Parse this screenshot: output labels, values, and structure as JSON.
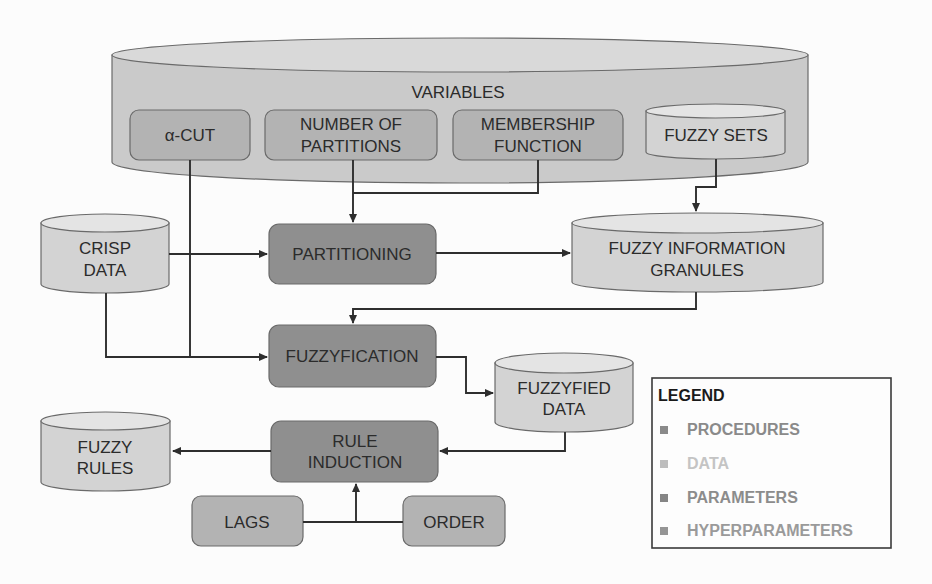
{
  "nodes": {
    "variables": {
      "label": "VARIABLES"
    },
    "alpha_cut": {
      "lines": [
        "α-CUT"
      ]
    },
    "number_of_partitions": {
      "lines": [
        "NUMBER OF",
        "PARTITIONS"
      ]
    },
    "membership_function": {
      "lines": [
        "MEMBERSHIP",
        "FUNCTION"
      ]
    },
    "fuzzy_sets": {
      "lines": [
        "FUZZY SETS"
      ]
    },
    "crisp_data": {
      "lines": [
        "CRISP",
        "DATA"
      ]
    },
    "partitioning": {
      "lines": [
        "PARTITIONING"
      ]
    },
    "fuzzy_information_granules": {
      "lines": [
        "FUZZY INFORMATION",
        "GRANULES"
      ]
    },
    "fuzzyfication": {
      "lines": [
        "FUZZYFICATION"
      ]
    },
    "fuzzyfied_data": {
      "lines": [
        "FUZZYFIED",
        "DATA"
      ]
    },
    "rule_induction": {
      "lines": [
        "RULE",
        "INDUCTION"
      ]
    },
    "fuzzy_rules": {
      "lines": [
        "FUZZY",
        "RULES"
      ]
    },
    "lags": {
      "lines": [
        "LAGS"
      ]
    },
    "order": {
      "lines": [
        "ORDER"
      ]
    }
  },
  "edges": [
    {
      "from": "number_of_partitions",
      "to": "partitioning"
    },
    {
      "from": "membership_function",
      "to": "partitioning"
    },
    {
      "from": "crisp_data",
      "to": "partitioning"
    },
    {
      "from": "fuzzy_sets",
      "to": "fuzzy_information_granules"
    },
    {
      "from": "partitioning",
      "to": "fuzzy_information_granules"
    },
    {
      "from": "alpha_cut",
      "to": "fuzzyfication"
    },
    {
      "from": "crisp_data",
      "to": "fuzzyfication"
    },
    {
      "from": "fuzzy_information_granules",
      "to": "fuzzyfication"
    },
    {
      "from": "fuzzyfication",
      "to": "fuzzyfied_data"
    },
    {
      "from": "fuzzyfied_data",
      "to": "rule_induction"
    },
    {
      "from": "lags",
      "to": "rule_induction"
    },
    {
      "from": "order",
      "to": "rule_induction"
    },
    {
      "from": "rule_induction",
      "to": "fuzzy_rules"
    }
  ],
  "legend": {
    "title": "LEGEND",
    "items": [
      {
        "label": "PROCEDURES",
        "color": "#8a8a8a"
      },
      {
        "label": "DATA",
        "color": "#c4c4c4"
      },
      {
        "label": "PARAMETERS",
        "color": "#8c8c8c"
      },
      {
        "label": "HYPERPARAMETERS",
        "color": "#9a9a9a"
      }
    ]
  },
  "colors": {
    "procedure_fill": "#8f8f8f",
    "parameter_fill": "#b3b3b3",
    "data_fill": "#d3d3d3",
    "data_top_fill": "#e4e4e4",
    "variables_fill": "#cacaca",
    "variables_top_fill": "#d9d9d9"
  }
}
